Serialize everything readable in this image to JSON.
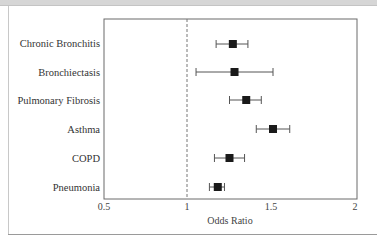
{
  "chart_data": {
    "type": "forest",
    "title": "",
    "xlabel": "Odds Ratio",
    "ylabel": "",
    "xlim": [
      0.5,
      2
    ],
    "xscale": "linear",
    "xticks": [
      0.5,
      1,
      1.5,
      2
    ],
    "xtick_labels": [
      "0.5",
      "1",
      "1.5",
      "2"
    ],
    "reference_line": {
      "x": 1,
      "style": "dashed"
    },
    "grid": false,
    "legend": null,
    "categories": [
      "Chronic Bronchitis",
      "Bronchiectasis",
      "Pulmonary Fibrosis",
      "Asthma",
      "COPD",
      "Pneumonia"
    ],
    "series": [
      {
        "name": "Odds Ratio",
        "values": [
          1.27,
          1.28,
          1.35,
          1.51,
          1.25,
          1.18
        ],
        "ci_lower": [
          1.17,
          1.05,
          1.25,
          1.41,
          1.16,
          1.13
        ],
        "ci_upper": [
          1.36,
          1.51,
          1.44,
          1.61,
          1.34,
          1.22
        ]
      }
    ]
  },
  "labels": {
    "categories": [
      "Chronic Bronchitis",
      "Bronchiectasis",
      "Pulmonary Fibrosis",
      "Asthma",
      "COPD",
      "Pneumonia"
    ],
    "xticks": [
      "0.5",
      "1",
      "1.5",
      "2"
    ],
    "xlabel": "Odds Ratio"
  },
  "colors": {
    "marker": "#1a1a1a",
    "whisker": "#555555",
    "axis": "#666666",
    "reference_line": "#777777"
  }
}
